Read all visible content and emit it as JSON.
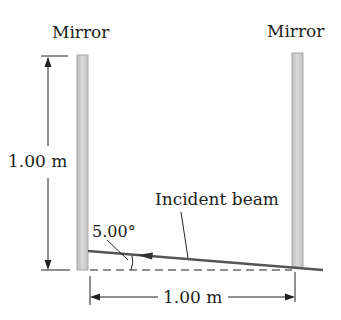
{
  "diagram": {
    "labels": {
      "mirror_left": "Mirror",
      "mirror_right": "Mirror",
      "height_dimension": "1.00 m",
      "width_dimension": "1.00 m",
      "angle": "5.00°",
      "incident_beam": "Incident beam"
    },
    "colors": {
      "mirror_fill": "#cfcfcf",
      "mirror_edge": "#a8a8a8",
      "beam": "#555555",
      "line": "#222222",
      "text": "#222222"
    }
  }
}
